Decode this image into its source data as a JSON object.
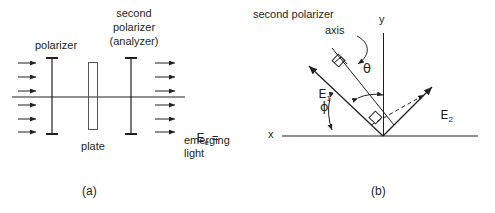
{
  "figure": {
    "background_color": "#ffffff",
    "line_color": "#231f20",
    "panels": [
      {
        "id": "a",
        "caption": "(a)",
        "labels": {
          "polarizer": "polarizer",
          "second_polarizer_line1": "second",
          "second_polarizer_line2": "polarizer",
          "second_polarizer_line3": "(analyzer)",
          "plate": "plate",
          "emerging_symbol": "E",
          "emerging_subscript": "e",
          "emerging_equals": " =",
          "emerging_line2": "emerging",
          "emerging_line3": "light"
        },
        "elements": {
          "incoming_rays": 6,
          "outgoing_rays": 6,
          "optical_axis": true,
          "plate_rectangle": true
        }
      },
      {
        "id": "b",
        "caption": "(b)",
        "labels": {
          "second_polarizer_axis_line1": "second polarizer",
          "second_polarizer_axis_line2": "axis",
          "x_axis": "x",
          "y_axis": "y",
          "e1_symbol": "E",
          "e1_subscript": "1",
          "e2_symbol": "E",
          "e2_subscript": "2",
          "theta": "θ",
          "phi": "ϕ"
        },
        "elements": {
          "vertex": [
            383,
            136
          ],
          "e1_vector": true,
          "e2_vector": true,
          "dashed_projection": true,
          "right_angle_markers": 2,
          "theta_arc": true,
          "phi_arc": true,
          "curved_pointer": true
        }
      }
    ]
  }
}
